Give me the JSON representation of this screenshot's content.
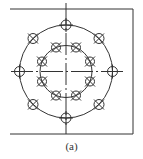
{
  "caption": "(a)",
  "colors": {
    "stroke": "#333333",
    "background": "#ffffff"
  },
  "drawing": {
    "type": "bolt-hole-pattern",
    "center": [
      66,
      71.5
    ],
    "outer_circle": {
      "radius": 46.5,
      "holes": 8,
      "hole_radius": 5
    },
    "inner_circle": {
      "radius": 26,
      "holes": 8,
      "hole_radius": 5
    },
    "frame": {
      "top_y": 9,
      "bottom_y": 134,
      "left_x": 10,
      "right_x": 133,
      "open_side": "left"
    }
  }
}
